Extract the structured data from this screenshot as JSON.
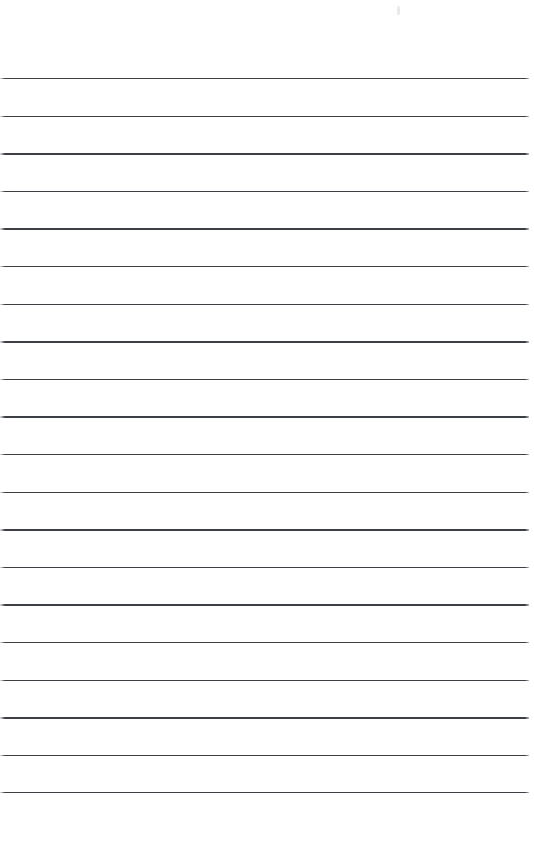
{
  "document": {
    "kind": "ruled-notepaper",
    "title": "Blank Ruled Notepaper Page",
    "page_width": 534,
    "page_height": 865,
    "background_color": "#ffffff",
    "content_text": "",
    "is_blank": true
  },
  "ruling": {
    "line_color": "#3c3f43",
    "line_thickness_px": 1.4,
    "line_count": 20,
    "line_spacing_px": 37.6,
    "first_line_y": 78,
    "last_line_y": 792,
    "line_start_x": 0,
    "line_end_x": 529,
    "line_length_px": 529,
    "line_y_positions": [
      78,
      115.6,
      153.2,
      190.8,
      228.4,
      266,
      303.6,
      341.2,
      378.8,
      416.4,
      454,
      491.6,
      529.2,
      566.8,
      604.4,
      642,
      679.6,
      717.2,
      754.8,
      792
    ]
  },
  "margins": {
    "top_margin_px": 78,
    "bottom_margin_px": 73,
    "left_margin_px": 0,
    "right_margin_px": 5
  },
  "artifacts": {
    "scan_speck": {
      "name": "faint-scan-speck",
      "x": 397,
      "y": 6,
      "width": 3,
      "height": 9,
      "color": "rgba(120,120,125,0.16)"
    }
  }
}
